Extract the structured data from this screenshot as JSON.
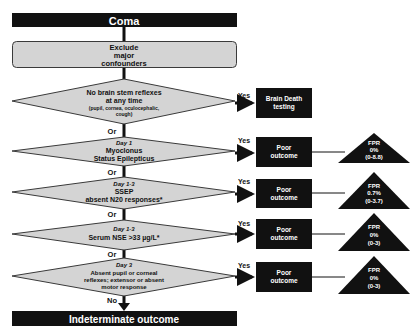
{
  "colors": {
    "box_dark": "#111111",
    "node_fill": "#d4d4d4",
    "node_stroke": "#3a3a3a",
    "text_light": "#ffffff",
    "text_dark": "#111111"
  },
  "start": {
    "label": "Coma"
  },
  "exclude": {
    "lines": [
      "Exclude",
      "major",
      "confounders"
    ]
  },
  "decisions": [
    {
      "day": "",
      "lines": [
        "No brain stem reflexes",
        "at any time"
      ],
      "note": [
        "(pupil, cornea, oculocephalic,",
        "cough)"
      ],
      "yes_label": "Yes",
      "outcome": [
        "Brain Death",
        "testing"
      ],
      "fpr": null
    },
    {
      "day": "Day 1",
      "lines": [
        "Myoclonus",
        "Status Epilepticus"
      ],
      "yes_label": "Yes",
      "outcome": [
        "Poor",
        "outcome"
      ],
      "fpr": [
        "FPR",
        "0%",
        "(0-8.8)"
      ]
    },
    {
      "day": "Day 1-3",
      "lines": [
        "SSEP",
        "absent N20 responses*"
      ],
      "yes_label": "Yes",
      "outcome": [
        "Poor",
        "outcome"
      ],
      "fpr": [
        "FPR",
        "0.7%",
        "(0-3.7)"
      ]
    },
    {
      "day": "Day 1-3",
      "lines": [
        "Serum NSE >33 µg/L*"
      ],
      "yes_label": "Yes",
      "outcome": [
        "Poor",
        "outcome"
      ],
      "fpr": [
        "FPR",
        "0%",
        "(0-3)"
      ]
    },
    {
      "day": "Day 3",
      "lines": [
        "Absent pupil or corneal",
        "reflexes; extensor or absent",
        "motor response"
      ],
      "yes_label": "Yes",
      "outcome": [
        "Poor",
        "outcome"
      ],
      "fpr": [
        "FPR",
        "0%",
        "(0-3)"
      ]
    }
  ],
  "connectors": {
    "or_label": "Or",
    "no_label": "No"
  },
  "end": {
    "label": "Indeterminate outcome"
  }
}
